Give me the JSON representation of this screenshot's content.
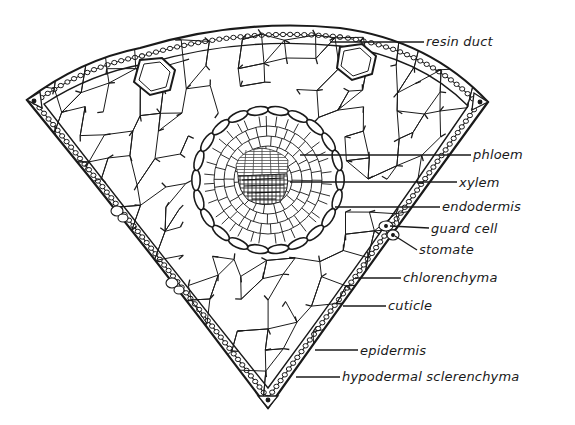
{
  "figure": {
    "colors": {
      "ink": "#1a1a1a",
      "background": "#ffffff",
      "xylem_shade": "#2a2a2a",
      "phloem_shade": "#555555"
    },
    "labels": [
      {
        "id": "resin-duct",
        "text": "resin duct",
        "x": 426,
        "y": 35,
        "line_from": [
          330,
          42
        ],
        "line_to": [
          424,
          42
        ]
      },
      {
        "id": "phloem",
        "text": "phloem",
        "x": 473,
        "y": 148,
        "line_from": [
          300,
          155
        ],
        "line_to": [
          471,
          155
        ]
      },
      {
        "id": "xylem",
        "text": "xylem",
        "x": 459,
        "y": 176,
        "line_from": [
          290,
          182
        ],
        "line_to": [
          457,
          182
        ]
      },
      {
        "id": "endodermis",
        "text": "endodermis",
        "x": 442,
        "y": 200,
        "line_from": [
          335,
          207
        ],
        "line_to": [
          440,
          207
        ]
      },
      {
        "id": "guard-cell",
        "text": "guard cell",
        "x": 431,
        "y": 222,
        "line_from": [
          390,
          226
        ],
        "line_to": [
          429,
          228
        ]
      },
      {
        "id": "stomate",
        "text": "stomate",
        "x": 419,
        "y": 243,
        "line_from": [
          395,
          236
        ],
        "line_to": [
          417,
          250
        ]
      },
      {
        "id": "chlorenchyma",
        "text": "chlorenchyma",
        "x": 403,
        "y": 271,
        "line_from": [
          355,
          278
        ],
        "line_to": [
          401,
          278
        ]
      },
      {
        "id": "cuticle",
        "text": "cuticle",
        "x": 388,
        "y": 299,
        "line_from": [
          343,
          306
        ],
        "line_to": [
          386,
          306
        ]
      },
      {
        "id": "epidermis",
        "text": "epidermis",
        "x": 360,
        "y": 344,
        "line_from": [
          315,
          350
        ],
        "line_to": [
          358,
          350
        ]
      },
      {
        "id": "hypodermal-sclerenchyma",
        "text": "hypodermal sclerenchyma",
        "x": 342,
        "y": 370,
        "line_from": [
          296,
          377
        ],
        "line_to": [
          340,
          377
        ]
      }
    ]
  }
}
